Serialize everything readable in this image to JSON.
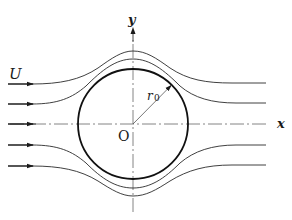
{
  "diagram": {
    "labels": {
      "free_stream": "U",
      "y_axis": "y",
      "x_axis": "x",
      "origin": "O",
      "radius": "r",
      "radius_subscript": "0"
    },
    "colors": {
      "line": "#2a2a2a",
      "axis": "#555555",
      "background": "#ffffff"
    },
    "cylinder": {
      "center": [
        133,
        124
      ],
      "radius": 55
    },
    "streamlines": {
      "count_upstream_arrows": 5,
      "upstream_arrow_y": [
        84,
        104,
        124,
        145,
        166
      ]
    }
  }
}
